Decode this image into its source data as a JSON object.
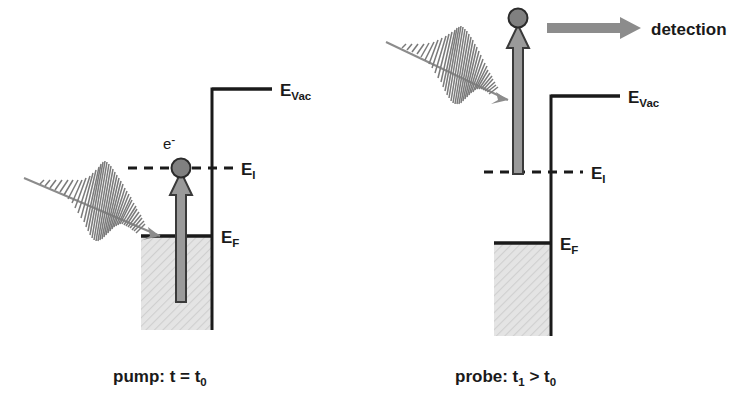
{
  "figure": {
    "background_color": "#ffffff",
    "line_color": "#1a1a1a",
    "gray_arrow_color": "#8c8c8c",
    "gray_arrow_edge_color": "#4d4d4d",
    "electron_fill_color": "#808080",
    "hatch_fill_color": "#d9d9d9"
  },
  "panels": [
    {
      "id": "pump",
      "caption": "pump: t = t",
      "caption_sub": "0",
      "levels": [
        {
          "name": "vacuum-level",
          "label": "E",
          "sub": "Vac",
          "style": "solid"
        },
        {
          "name": "intermediate-level",
          "label": "E",
          "sub": "I",
          "style": "dashed"
        },
        {
          "name": "fermi-level",
          "label": "E",
          "sub": "F",
          "style": "solid"
        }
      ],
      "electron": {
        "label": "e",
        "superscript": "-",
        "position": "at-intermediate-level"
      },
      "excitation_arrow": {
        "from": "below-fermi-level",
        "to": "intermediate-level"
      },
      "light_pulse": {
        "name": "pump-pulse",
        "direction": "down-right",
        "target": "fermi-level-surface"
      }
    },
    {
      "id": "probe",
      "caption": "probe: t",
      "caption_sub1": "1",
      "caption_mid": " > t",
      "caption_sub2": "0",
      "levels": [
        {
          "name": "vacuum-level",
          "label": "E",
          "sub": "Vac",
          "style": "solid"
        },
        {
          "name": "intermediate-level",
          "label": "E",
          "sub": "I",
          "style": "dashed"
        },
        {
          "name": "fermi-level",
          "label": "E",
          "sub": "F",
          "style": "solid"
        }
      ],
      "electron": {
        "label": "",
        "superscript": "",
        "position": "above-vacuum-level"
      },
      "excitation_arrow": {
        "from": "intermediate-level",
        "to": "above-vacuum-level"
      },
      "light_pulse": {
        "name": "probe-pulse",
        "direction": "down-right",
        "target": "intermediate-level"
      },
      "detection": {
        "label": "detection",
        "arrow_direction": "right"
      }
    }
  ]
}
